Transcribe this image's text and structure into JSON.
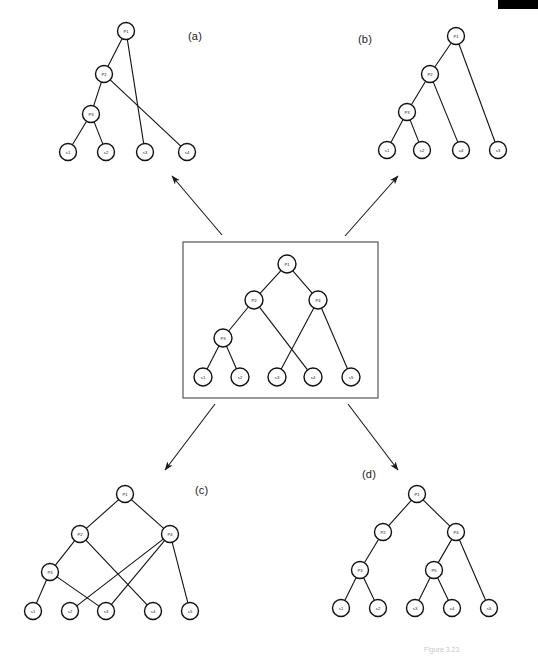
{
  "figure": {
    "background_color": "#ffffff",
    "stroke_color": "#111111",
    "box_stroke_color": "#555555",
    "width": 538,
    "height": 659
  },
  "panels": [
    {
      "id": "a",
      "label": "(a)",
      "label_x": 188,
      "label_y": 30
    },
    {
      "id": "b",
      "label": "(b)",
      "label_x": 358,
      "label_y": 33
    },
    {
      "id": "c",
      "label": "(c)",
      "label_x": 195,
      "label_y": 484
    },
    {
      "id": "d",
      "label": "(d)",
      "label_x": 362,
      "label_y": 468
    }
  ],
  "center": {
    "name": "center-boxed-tree",
    "box": {
      "x": 183,
      "y": 242,
      "width": 195,
      "height": 156
    }
  },
  "bottom_caption": "Figure 3.23",
  "graphs": {
    "panel_a": {
      "nodes": [
        {
          "id": "P1",
          "label": "P1",
          "x": 126,
          "y": 31,
          "r": 8.5
        },
        {
          "id": "P2",
          "label": "P2",
          "x": 104,
          "y": 74,
          "r": 8.5
        },
        {
          "id": "P3",
          "label": "P3",
          "x": 91,
          "y": 114,
          "r": 8.5
        },
        {
          "id": "s1",
          "label": "s1",
          "x": 68,
          "y": 152,
          "r": 8.5
        },
        {
          "id": "s2",
          "label": "s2",
          "x": 106,
          "y": 152,
          "r": 8.5
        },
        {
          "id": "s3",
          "label": "s3",
          "x": 145,
          "y": 152,
          "r": 8.5
        },
        {
          "id": "s4",
          "label": "s4",
          "x": 187,
          "y": 152,
          "r": 8.5
        }
      ],
      "edges": [
        [
          "P1",
          "P2"
        ],
        [
          "P1",
          "s3"
        ],
        [
          "P2",
          "P3"
        ],
        [
          "P2",
          "s4"
        ],
        [
          "P3",
          "s1"
        ],
        [
          "P3",
          "s2"
        ]
      ]
    },
    "panel_b": {
      "nodes": [
        {
          "id": "P1",
          "label": "P1",
          "x": 456,
          "y": 36,
          "r": 8.5
        },
        {
          "id": "P2",
          "label": "P2",
          "x": 430,
          "y": 74,
          "r": 8.5
        },
        {
          "id": "P3",
          "label": "P3",
          "x": 407,
          "y": 112,
          "r": 8.5
        },
        {
          "id": "s1",
          "label": "s1",
          "x": 387,
          "y": 150,
          "r": 8.5
        },
        {
          "id": "s2",
          "label": "s2",
          "x": 422,
          "y": 150,
          "r": 8.5
        },
        {
          "id": "s4",
          "label": "s4",
          "x": 461,
          "y": 150,
          "r": 8.5
        },
        {
          "id": "s3",
          "label": "s3",
          "x": 498,
          "y": 150,
          "r": 8.5
        }
      ],
      "edges": [
        [
          "P1",
          "P2"
        ],
        [
          "P1",
          "s3"
        ],
        [
          "P2",
          "P3"
        ],
        [
          "P2",
          "s4"
        ],
        [
          "P3",
          "s1"
        ],
        [
          "P3",
          "s2"
        ]
      ]
    },
    "panel_center": {
      "nodes": [
        {
          "id": "P1",
          "label": "P1",
          "x": 287,
          "y": 264,
          "r": 9
        },
        {
          "id": "P2",
          "label": "P2",
          "x": 254,
          "y": 300,
          "r": 9
        },
        {
          "id": "P4",
          "label": "P4",
          "x": 318,
          "y": 300,
          "r": 9
        },
        {
          "id": "P3",
          "label": "P3",
          "x": 223,
          "y": 338,
          "r": 9
        },
        {
          "id": "s1",
          "label": "s1",
          "x": 203,
          "y": 377,
          "r": 9
        },
        {
          "id": "s2",
          "label": "s2",
          "x": 240,
          "y": 377,
          "r": 9
        },
        {
          "id": "s3",
          "label": "s3",
          "x": 277,
          "y": 377,
          "r": 9
        },
        {
          "id": "s4",
          "label": "s4",
          "x": 313,
          "y": 377,
          "r": 9
        },
        {
          "id": "s5",
          "label": "s5",
          "x": 351,
          "y": 377,
          "r": 9
        }
      ],
      "edges": [
        [
          "P1",
          "P2"
        ],
        [
          "P1",
          "P4"
        ],
        [
          "P2",
          "P3"
        ],
        [
          "P2",
          "s4"
        ],
        [
          "P4",
          "s3"
        ],
        [
          "P4",
          "s5"
        ],
        [
          "P3",
          "s1"
        ],
        [
          "P3",
          "s2"
        ]
      ]
    },
    "panel_c": {
      "nodes": [
        {
          "id": "P1",
          "label": "P1",
          "x": 125,
          "y": 494,
          "r": 8.5
        },
        {
          "id": "P2",
          "label": "P2",
          "x": 80,
          "y": 534,
          "r": 8.5
        },
        {
          "id": "P4",
          "label": "P4",
          "x": 170,
          "y": 534,
          "r": 8.5
        },
        {
          "id": "P3",
          "label": "P3",
          "x": 50,
          "y": 572,
          "r": 8.5
        },
        {
          "id": "s1",
          "label": "s1",
          "x": 33,
          "y": 611,
          "r": 8.5
        },
        {
          "id": "s2",
          "label": "s2",
          "x": 70,
          "y": 611,
          "r": 8.5
        },
        {
          "id": "s3",
          "label": "s3",
          "x": 106,
          "y": 611,
          "r": 8.5
        },
        {
          "id": "s4",
          "label": "s4",
          "x": 153,
          "y": 611,
          "r": 8.5
        },
        {
          "id": "s5",
          "label": "s5",
          "x": 190,
          "y": 611,
          "r": 8.5
        }
      ],
      "edges": [
        [
          "P1",
          "P2"
        ],
        [
          "P1",
          "P4"
        ],
        [
          "P2",
          "P3"
        ],
        [
          "P2",
          "s4"
        ],
        [
          "P3",
          "s1"
        ],
        [
          "P3",
          "s3"
        ],
        [
          "P4",
          "s2"
        ],
        [
          "P4",
          "s3"
        ],
        [
          "P4",
          "s5"
        ]
      ]
    },
    "panel_d": {
      "nodes": [
        {
          "id": "P1",
          "label": "P1",
          "x": 417,
          "y": 494,
          "r": 8.5
        },
        {
          "id": "P2",
          "label": "P2",
          "x": 383,
          "y": 532,
          "r": 8.5
        },
        {
          "id": "P4",
          "label": "P4",
          "x": 456,
          "y": 532,
          "r": 8.5
        },
        {
          "id": "P3",
          "label": "P3",
          "x": 360,
          "y": 570,
          "r": 8.5
        },
        {
          "id": "P5",
          "label": "P5",
          "x": 434,
          "y": 570,
          "r": 8.5
        },
        {
          "id": "s1",
          "label": "s1",
          "x": 341,
          "y": 608,
          "r": 8.5
        },
        {
          "id": "s2",
          "label": "s2",
          "x": 378,
          "y": 608,
          "r": 8.5
        },
        {
          "id": "s3",
          "label": "s3",
          "x": 415,
          "y": 608,
          "r": 8.5
        },
        {
          "id": "s4",
          "label": "s4",
          "x": 452,
          "y": 608,
          "r": 8.5
        },
        {
          "id": "s5",
          "label": "s5",
          "x": 489,
          "y": 608,
          "r": 8.5
        }
      ],
      "edges": [
        [
          "P1",
          "P2"
        ],
        [
          "P1",
          "P4"
        ],
        [
          "P2",
          "P3"
        ],
        [
          "P4",
          "P5"
        ],
        [
          "P4",
          "s5"
        ],
        [
          "P3",
          "s1"
        ],
        [
          "P3",
          "s2"
        ],
        [
          "P5",
          "s3"
        ],
        [
          "P5",
          "s4"
        ]
      ]
    }
  },
  "arrows": [
    {
      "name": "arrow-to-panel-a",
      "x1": 222,
      "y1": 235,
      "x2": 172,
      "y2": 176
    },
    {
      "name": "arrow-to-panel-b",
      "x1": 345,
      "y1": 236,
      "x2": 398,
      "y2": 176
    },
    {
      "name": "arrow-to-panel-c",
      "x1": 215,
      "y1": 404,
      "x2": 165,
      "y2": 470
    },
    {
      "name": "arrow-to-panel-d",
      "x1": 348,
      "y1": 404,
      "x2": 398,
      "y2": 470
    }
  ],
  "top_bar": {
    "x": 498,
    "y": 0,
    "width": 40,
    "height": 9,
    "color": "#000000"
  }
}
